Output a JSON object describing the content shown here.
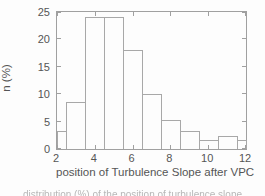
{
  "figure": {
    "background": "#fdfdfd",
    "line_color": "#a0a0a0",
    "text_color": "#555555",
    "bar_fill": "none (white, outline only)"
  },
  "chart_data": {
    "type": "bar",
    "subtype": "histogram",
    "title": "",
    "xlabel": "position of Turbulence Slope after VPC",
    "ylabel": "n (%)",
    "xlim": [
      2,
      12
    ],
    "ylim": [
      0,
      25
    ],
    "x_ticks": [
      2,
      4,
      6,
      8,
      10,
      12
    ],
    "y_ticks": [
      0,
      5,
      10,
      15,
      20,
      25
    ],
    "grid": false,
    "legend_position": "none",
    "box": true,
    "bin_centers": [
      2,
      3,
      4,
      5,
      6,
      7,
      8,
      9,
      10,
      11,
      12
    ],
    "bars": [
      {
        "x0": 2,
        "x1": 2.5,
        "value": 3.2
      },
      {
        "x0": 2.5,
        "x1": 3.5,
        "value": 8.6
      },
      {
        "x0": 3.5,
        "x1": 4.5,
        "value": 24
      },
      {
        "x0": 4.5,
        "x1": 5.5,
        "value": 24
      },
      {
        "x0": 5.5,
        "x1": 6.5,
        "value": 18
      },
      {
        "x0": 6.5,
        "x1": 7.5,
        "value": 10
      },
      {
        "x0": 7.5,
        "x1": 8.5,
        "value": 5.3
      },
      {
        "x0": 8.5,
        "x1": 9.5,
        "value": 3.2
      },
      {
        "x0": 9.5,
        "x1": 10.5,
        "value": 1.7
      },
      {
        "x0": 10.5,
        "x1": 11.5,
        "value": 2.3
      },
      {
        "x0": 11.5,
        "x1": 12,
        "value": 1.7
      }
    ]
  },
  "caption": {
    "text": "distribution (%) of the position of turbulence slope",
    "partially_visible": true
  }
}
